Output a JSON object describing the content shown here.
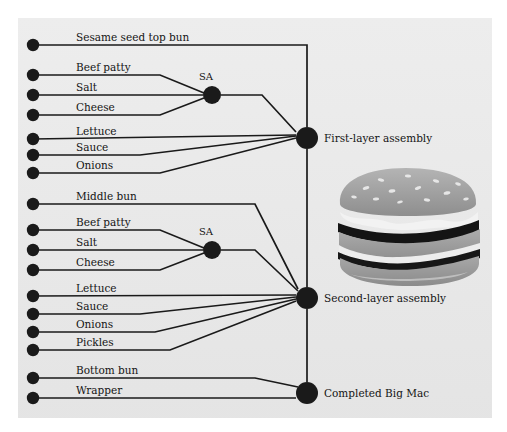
{
  "figure": {
    "background_color": "#e9e9e9",
    "ink_color": "#1a1a1a",
    "panel": {
      "x": 18,
      "y": 18,
      "width": 474,
      "height": 400
    }
  },
  "components": [
    {
      "id": "c1",
      "label": "Sesame seed top bun",
      "dot": {
        "x": 33,
        "y": 45
      },
      "label_pos": {
        "x": 76,
        "y": 41
      }
    },
    {
      "id": "c2",
      "label": "Beef patty",
      "dot": {
        "x": 33,
        "y": 75
      },
      "label_pos": {
        "x": 76,
        "y": 71
      }
    },
    {
      "id": "c3",
      "label": "Salt",
      "dot": {
        "x": 33,
        "y": 95
      },
      "label_pos": {
        "x": 76,
        "y": 91
      }
    },
    {
      "id": "c4",
      "label": "Cheese",
      "dot": {
        "x": 33,
        "y": 115
      },
      "label_pos": {
        "x": 76,
        "y": 111
      }
    },
    {
      "id": "c5",
      "label": "Lettuce",
      "dot": {
        "x": 33,
        "y": 139
      },
      "label_pos": {
        "x": 76,
        "y": 135
      }
    },
    {
      "id": "c6",
      "label": "Sauce",
      "dot": {
        "x": 33,
        "y": 155
      },
      "label_pos": {
        "x": 76,
        "y": 151
      }
    },
    {
      "id": "c7",
      "label": "Onions",
      "dot": {
        "x": 33,
        "y": 173
      },
      "label_pos": {
        "x": 76,
        "y": 169
      }
    },
    {
      "id": "c8",
      "label": "Middle bun",
      "dot": {
        "x": 33,
        "y": 204
      },
      "label_pos": {
        "x": 76,
        "y": 200
      }
    },
    {
      "id": "c9",
      "label": "Beef patty",
      "dot": {
        "x": 33,
        "y": 230
      },
      "label_pos": {
        "x": 76,
        "y": 226
      }
    },
    {
      "id": "c10",
      "label": "Salt",
      "dot": {
        "x": 33,
        "y": 250
      },
      "label_pos": {
        "x": 76,
        "y": 246
      }
    },
    {
      "id": "c11",
      "label": "Cheese",
      "dot": {
        "x": 33,
        "y": 270
      },
      "label_pos": {
        "x": 76,
        "y": 266
      }
    },
    {
      "id": "c12",
      "label": "Lettuce",
      "dot": {
        "x": 33,
        "y": 296
      },
      "label_pos": {
        "x": 76,
        "y": 292
      }
    },
    {
      "id": "c13",
      "label": "Sauce",
      "dot": {
        "x": 33,
        "y": 314
      },
      "label_pos": {
        "x": 76,
        "y": 310
      }
    },
    {
      "id": "c14",
      "label": "Onions",
      "dot": {
        "x": 33,
        "y": 332
      },
      "label_pos": {
        "x": 76,
        "y": 328
      }
    },
    {
      "id": "c15",
      "label": "Pickles",
      "dot": {
        "x": 33,
        "y": 350
      },
      "label_pos": {
        "x": 76,
        "y": 346
      }
    },
    {
      "id": "c16",
      "label": "Bottom bun",
      "dot": {
        "x": 33,
        "y": 378
      },
      "label_pos": {
        "x": 76,
        "y": 374
      }
    },
    {
      "id": "c17",
      "label": "Wrapper",
      "dot": {
        "x": 33,
        "y": 398
      },
      "label_pos": {
        "x": 76,
        "y": 394
      }
    }
  ],
  "nodes": [
    {
      "id": "sa1",
      "label": "SA",
      "x": 212,
      "y": 95,
      "r": 9,
      "label_pos": {
        "x": 206,
        "y": 80
      },
      "label_anchor": "middle"
    },
    {
      "id": "sa2",
      "label": "SA",
      "x": 212,
      "y": 250,
      "r": 9,
      "label_pos": {
        "x": 206,
        "y": 235
      },
      "label_anchor": "middle"
    },
    {
      "id": "first",
      "label": "First-layer assembly",
      "x": 307,
      "y": 138,
      "r": 11,
      "label_pos": {
        "x": 324,
        "y": 142
      },
      "label_anchor": "start"
    },
    {
      "id": "second",
      "label": "Second-layer assembly",
      "x": 307,
      "y": 298,
      "r": 11,
      "label_pos": {
        "x": 324,
        "y": 302
      },
      "label_anchor": "start"
    },
    {
      "id": "done",
      "label": "Completed Big Mac",
      "x": 307,
      "y": 393,
      "r": 11,
      "label_pos": {
        "x": 324,
        "y": 397
      },
      "label_anchor": "start"
    }
  ],
  "edges": [
    {
      "name": "sesame-top-bun-to-first-layer",
      "points": "33,45 307,45 307,127"
    },
    {
      "name": "beef-patty-1-to-sa1",
      "points": "33,75 160,75 204,93"
    },
    {
      "name": "salt-1-to-sa1",
      "points": "33,95 203,95"
    },
    {
      "name": "cheese-1-to-sa1",
      "points": "33,115 160,115 204,98"
    },
    {
      "name": "sa1-to-first-layer",
      "points": "221,95 262,95 296,132"
    },
    {
      "name": "lettuce-1-to-first-layer",
      "points": "33,139 296,135"
    },
    {
      "name": "sauce-1-to-first-layer",
      "points": "33,155 140,155 296,136"
    },
    {
      "name": "onions-1-to-first-layer",
      "points": "33,173 160,173 296,138"
    },
    {
      "name": "first-layer-to-second-layer",
      "points": "307,149 307,287"
    },
    {
      "name": "middle-bun-to-second-layer",
      "points": "33,204 255,204 298,289"
    },
    {
      "name": "beef-patty-2-to-sa2",
      "points": "33,230 160,230 204,248"
    },
    {
      "name": "salt-2-to-sa2",
      "points": "33,250 203,250"
    },
    {
      "name": "cheese-2-to-sa2",
      "points": "33,270 160,270 204,253"
    },
    {
      "name": "sa2-to-second-layer",
      "points": "221,250 255,250 298,291"
    },
    {
      "name": "lettuce-2-to-second-layer",
      "points": "33,296 296,295"
    },
    {
      "name": "sauce-2-to-second-layer",
      "points": "33,314 140,314 296,297"
    },
    {
      "name": "onions-2-to-second-layer",
      "points": "33,332 155,332 296,299"
    },
    {
      "name": "pickles-to-second-layer",
      "points": "33,350 170,350 296,301"
    },
    {
      "name": "second-layer-to-completed",
      "points": "307,309 307,382"
    },
    {
      "name": "bottom-bun-to-completed",
      "points": "33,378 255,378 298,387"
    },
    {
      "name": "wrapper-to-completed",
      "points": "33,398 296,398"
    }
  ],
  "burger_image": {
    "alt": "Big Mac photograph",
    "bun_top_color": "#9a9a9a",
    "bun_mid_color": "#a0a0a0",
    "patty_color": "#151515",
    "cheese_color": "#f0f0f0",
    "seed_color": "#e8e8e8"
  }
}
